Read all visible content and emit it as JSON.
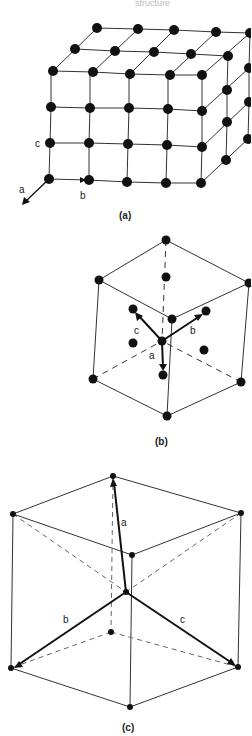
{
  "header": {
    "text": "structure"
  },
  "panels": [
    {
      "id": "a",
      "caption": "(a)",
      "axes": {
        "a": "a",
        "b": "b",
        "c": "c"
      },
      "description": "Simple cubic lattice block with primitive vectors a, b, c"
    },
    {
      "id": "b",
      "caption": "(b)",
      "axes": {
        "a": "a",
        "b": "b",
        "c": "c"
      },
      "description": "Face-centred cubic cell with primitive vectors"
    },
    {
      "id": "c",
      "caption": "(c)",
      "axes": {
        "a": "a",
        "b": "b",
        "c": "c"
      },
      "description": "Rhombohedral primitive cell vectors"
    }
  ],
  "colors": {
    "line": "#222222",
    "atom": "#111111",
    "background": "#ffffff"
  }
}
